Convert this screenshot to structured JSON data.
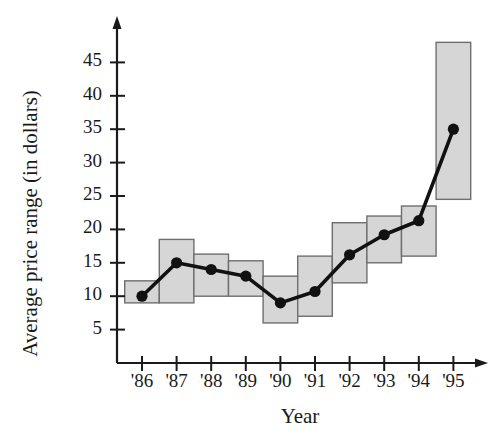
{
  "chart_data": {
    "type": "bar",
    "title": "",
    "subtitle": "",
    "xlabel": "Year",
    "ylabel": "Average price range (in dollars)",
    "categories": [
      "'86",
      "'87",
      "'88",
      "'89",
      "'90",
      "'91",
      "'92",
      "'93",
      "'94",
      "'95"
    ],
    "ytick_labels": [
      "5",
      "10",
      "15",
      "20",
      "25",
      "30",
      "35",
      "40",
      "45"
    ],
    "ytick_values": [
      5,
      10,
      15,
      20,
      25,
      30,
      35,
      40,
      45
    ],
    "ylim": [
      0,
      48
    ],
    "xlim_note": "categorical, one tick per year",
    "grid": false,
    "legend_position": "none",
    "series": [
      {
        "name": "Price range (high-low bars)",
        "type": "bar",
        "low": [
          9,
          9,
          10,
          10,
          6,
          7,
          12,
          15,
          16,
          24.5
        ],
        "high": [
          12.3,
          18.5,
          16.3,
          15.3,
          13,
          16,
          21,
          22,
          23.5,
          48
        ]
      },
      {
        "name": "Average price",
        "type": "line",
        "values": [
          10,
          15,
          14,
          13,
          9,
          10.7,
          16.2,
          19.2,
          21.3,
          35
        ]
      }
    ],
    "colors": {
      "bar_fill": "#d6d6d6",
      "bar_edge": "#6e6e6e",
      "line": "#111111",
      "marker": "#111111",
      "axis": "#1a1a1a",
      "background": "#ffffff"
    }
  }
}
